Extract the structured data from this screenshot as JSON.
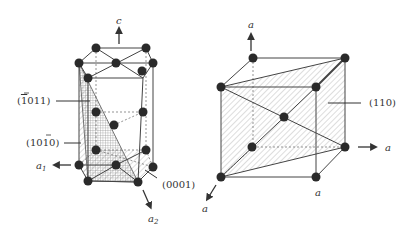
{
  "figure": {
    "hexagonal_cell": {
      "axis_c": "c",
      "axis_a1": "a",
      "axis_a1_sub": "1",
      "axis_a2": "a",
      "axis_a2_sub": "2",
      "plane_pyramidal": "(1̅0 1 1)",
      "plane_pyramidal_parts": {
        "open": "(",
        "bar_digit": "1",
        "rest": "011",
        "close": ")"
      },
      "plane_prismatic_parts": {
        "open": "(",
        "pre": "10",
        "bar_digit": "1",
        "rest": "0",
        "close": ")"
      },
      "plane_basal": "(0001)"
    },
    "cubic_cell": {
      "axis_top": "a",
      "axis_right": "a",
      "axis_front": "a",
      "edge_label": "a",
      "plane_label": "(110)"
    },
    "colors": {
      "line": "#444444",
      "atom": "#2a2a2a",
      "hatch": "#9a9a9a"
    }
  }
}
